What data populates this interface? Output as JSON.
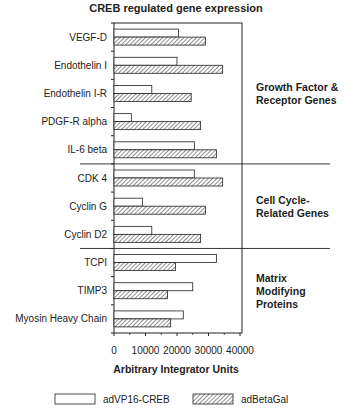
{
  "chart_data": {
    "type": "bar",
    "orientation": "horizontal",
    "title": "CREB regulated gene expression",
    "xlabel": "Arbitrary Integrator Units",
    "ylabel": "",
    "xlim": [
      0,
      40000
    ],
    "xticks": [
      0,
      10000,
      20000,
      30000,
      40000
    ],
    "xtick_labels": [
      "0",
      "10000",
      "20000",
      "30000",
      "40000"
    ],
    "grid": false,
    "legend_placement": "bottom",
    "categories": [
      "VEGF-D",
      "Endothelin I",
      "Endothelin I-R",
      "PDGF-R alpha",
      "IL-6 beta",
      "CDK 4",
      "Cyclin G",
      "Cyclin D2",
      "TCPI",
      "TIMP3",
      "Myosin Heavy Chain"
    ],
    "series": [
      {
        "name": "adVP16-CREB",
        "style": "open",
        "values": [
          20500,
          20000,
          12000,
          5500,
          25500,
          25500,
          9000,
          12000,
          32500,
          25000,
          22000
        ]
      },
      {
        "name": "adBetaGal",
        "style": "hatched",
        "values": [
          29000,
          34500,
          24500,
          27500,
          32500,
          34500,
          29000,
          27500,
          19500,
          17000,
          18000
        ]
      }
    ],
    "groups": [
      {
        "label_lines": [
          "Growth Factor &",
          "Receptor Genes"
        ],
        "categories": [
          "VEGF-D",
          "Endothelin I",
          "Endothelin I-R",
          "PDGF-R alpha",
          "IL-6 beta"
        ]
      },
      {
        "label_lines": [
          "Cell Cycle-",
          "Related Genes"
        ],
        "categories": [
          "CDK 4",
          "Cyclin G",
          "Cyclin D2"
        ]
      },
      {
        "label_lines": [
          "Matrix",
          "Modifying",
          "Proteins"
        ],
        "categories": [
          "TCPI",
          "TIMP3",
          "Myosin Heavy Chain"
        ]
      }
    ],
    "colors": {
      "ink": "#222222",
      "open_fill": "#ffffff",
      "background": "#ffffff"
    }
  }
}
